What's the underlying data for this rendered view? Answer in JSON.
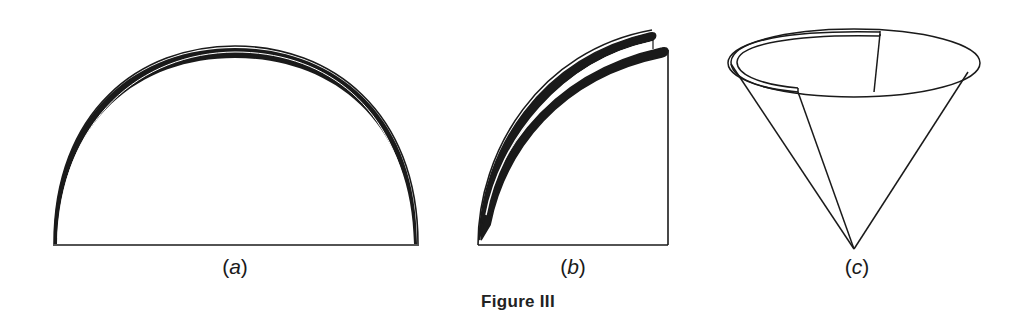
{
  "figure": {
    "caption": "Figure III",
    "panels": [
      {
        "id": "a",
        "label_open": "(",
        "label_letter": "a",
        "label_close": ")",
        "shape": "semicircle paper sheet"
      },
      {
        "id": "b",
        "label_open": "(",
        "label_letter": "b",
        "label_close": ")",
        "shape": "semicircle folded into quarter"
      },
      {
        "id": "c",
        "label_open": "(",
        "label_letter": "c",
        "label_close": ")",
        "shape": "cone / paper filter cup"
      }
    ],
    "colors": {
      "stroke": "#1a1a1a",
      "background": "#ffffff"
    }
  }
}
